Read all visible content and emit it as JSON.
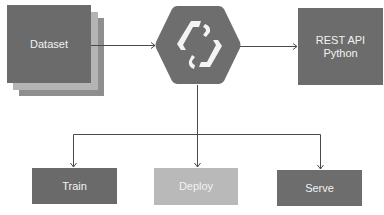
{
  "diagram": {
    "nodes": {
      "dataset": {
        "label": "Dataset",
        "color": "#6b6b6b"
      },
      "dataset_layer_2": {
        "color": "#b4b4b4"
      },
      "dataset_layer_3": {
        "color": "#8e8e8e"
      },
      "hub": {
        "icon": "stacked-brackets-logo-icon",
        "color": "#6e6e6e"
      },
      "rest_api": {
        "line1": "REST API",
        "line2": "Python",
        "color": "#6c6c6c"
      },
      "train": {
        "label": "Train",
        "color": "#6a6a6a"
      },
      "deploy": {
        "label": "Deploy",
        "color": "#b9b9b9"
      },
      "serve": {
        "label": "Serve",
        "color": "#6d6d6d"
      }
    },
    "edges": [
      {
        "from": "dataset",
        "to": "hub"
      },
      {
        "from": "hub",
        "to": "rest_api"
      },
      {
        "from": "hub",
        "to": "train"
      },
      {
        "from": "hub",
        "to": "deploy"
      },
      {
        "from": "hub",
        "to": "serve"
      }
    ],
    "line_color": "#4a4a4a"
  }
}
